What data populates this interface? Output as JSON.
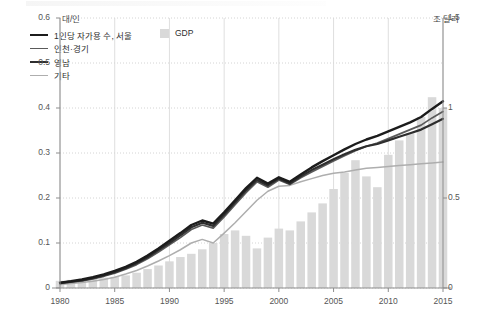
{
  "axes": {
    "left_unit": "대/인",
    "right_unit": "조 달러",
    "left_ticks": [
      "0",
      "0.1",
      "0.2",
      "0.3",
      "0.4",
      "0.5",
      "0.6"
    ],
    "right_ticks": [
      "0",
      "0.5",
      "1",
      "1.5"
    ],
    "x_ticks": [
      "1980",
      "1985",
      "1990",
      "1995",
      "2000",
      "2005",
      "2010",
      "2015"
    ]
  },
  "legend": {
    "lines": [
      {
        "label": "1인당 자가용 수, 서울",
        "color": "#1c1c1c",
        "width": 2.4
      },
      {
        "label": "인천·경기",
        "color": "#5a5a5a",
        "width": 1.7
      },
      {
        "label": "영남",
        "color": "#2e2e2e",
        "width": 2.2
      },
      {
        "label": "기타",
        "color": "#aeaeae",
        "width": 1.5
      }
    ],
    "bar_label": "GDP",
    "bar_color": "#d9d9d9"
  },
  "colors": {
    "bar": "#d9d9d9",
    "grid_dotted": "#c9c9c9",
    "grid_solid": "#d5d5d5",
    "axis": "#8d8d8d",
    "plot_bg": "#ffffff"
  },
  "chart_data": {
    "type": "line",
    "title": "",
    "subtitle": "",
    "xlabel": "",
    "ylabel": "대/인",
    "y2label": "조 달러",
    "xlim": [
      1980,
      2015
    ],
    "ylim": [
      0,
      0.6
    ],
    "y2lim": [
      0,
      1.5
    ],
    "grid": "horizontal-dotted, vertical-solid",
    "legend_position": "top-left",
    "x": [
      1980,
      1981,
      1982,
      1983,
      1984,
      1985,
      1986,
      1987,
      1988,
      1989,
      1990,
      1991,
      1992,
      1993,
      1994,
      1995,
      1996,
      1997,
      1998,
      1999,
      2000,
      2001,
      2002,
      2003,
      2004,
      2005,
      2006,
      2007,
      2008,
      2009,
      2010,
      2011,
      2012,
      2013,
      2014,
      2015
    ],
    "series": [
      {
        "name": "1인당 자가용 수, 서울",
        "color": "#1c1c1c",
        "axis": "left",
        "values": [
          0.012,
          0.015,
          0.019,
          0.024,
          0.03,
          0.038,
          0.047,
          0.058,
          0.072,
          0.088,
          0.105,
          0.122,
          0.14,
          0.15,
          0.143,
          0.168,
          0.195,
          0.222,
          0.245,
          0.232,
          0.246,
          0.236,
          0.252,
          0.268,
          0.282,
          0.295,
          0.308,
          0.32,
          0.33,
          0.338,
          0.348,
          0.358,
          0.368,
          0.38,
          0.398,
          0.415
        ]
      },
      {
        "name": "인천·경기",
        "color": "#5a5a5a",
        "axis": "left",
        "values": [
          0.01,
          0.013,
          0.016,
          0.02,
          0.026,
          0.033,
          0.042,
          0.052,
          0.065,
          0.08,
          0.096,
          0.112,
          0.13,
          0.14,
          0.133,
          0.158,
          0.185,
          0.212,
          0.236,
          0.224,
          0.24,
          0.23,
          0.245,
          0.258,
          0.27,
          0.282,
          0.294,
          0.305,
          0.315,
          0.322,
          0.332,
          0.342,
          0.352,
          0.362,
          0.378,
          0.392
        ]
      },
      {
        "name": "영남",
        "color": "#2e2e2e",
        "axis": "left",
        "values": [
          0.011,
          0.014,
          0.017,
          0.022,
          0.028,
          0.035,
          0.044,
          0.055,
          0.068,
          0.084,
          0.1,
          0.117,
          0.135,
          0.145,
          0.138,
          0.163,
          0.19,
          0.217,
          0.24,
          0.228,
          0.243,
          0.232,
          0.248,
          0.262,
          0.274,
          0.286,
          0.297,
          0.307,
          0.315,
          0.32,
          0.328,
          0.336,
          0.344,
          0.352,
          0.364,
          0.376
        ]
      },
      {
        "name": "기타",
        "color": "#aeaeae",
        "axis": "left",
        "values": [
          0.008,
          0.01,
          0.012,
          0.015,
          0.019,
          0.024,
          0.031,
          0.039,
          0.049,
          0.06,
          0.072,
          0.085,
          0.1,
          0.108,
          0.1,
          0.122,
          0.145,
          0.17,
          0.195,
          0.215,
          0.226,
          0.228,
          0.236,
          0.243,
          0.25,
          0.255,
          0.258,
          0.262,
          0.266,
          0.268,
          0.27,
          0.272,
          0.274,
          0.276,
          0.278,
          0.28
        ]
      }
    ],
    "bars": {
      "name": "GDP",
      "color": "#d9d9d9",
      "axis": "right",
      "unit": "조 달러",
      "values": [
        0.04,
        0.045,
        0.048,
        0.052,
        0.058,
        0.062,
        0.07,
        0.085,
        0.105,
        0.125,
        0.148,
        0.172,
        0.19,
        0.215,
        0.25,
        0.3,
        0.32,
        0.29,
        0.22,
        0.28,
        0.33,
        0.32,
        0.37,
        0.42,
        0.47,
        0.55,
        0.64,
        0.71,
        0.62,
        0.56,
        0.74,
        0.82,
        0.86,
        0.95,
        1.06,
        1.0
      ]
    }
  }
}
